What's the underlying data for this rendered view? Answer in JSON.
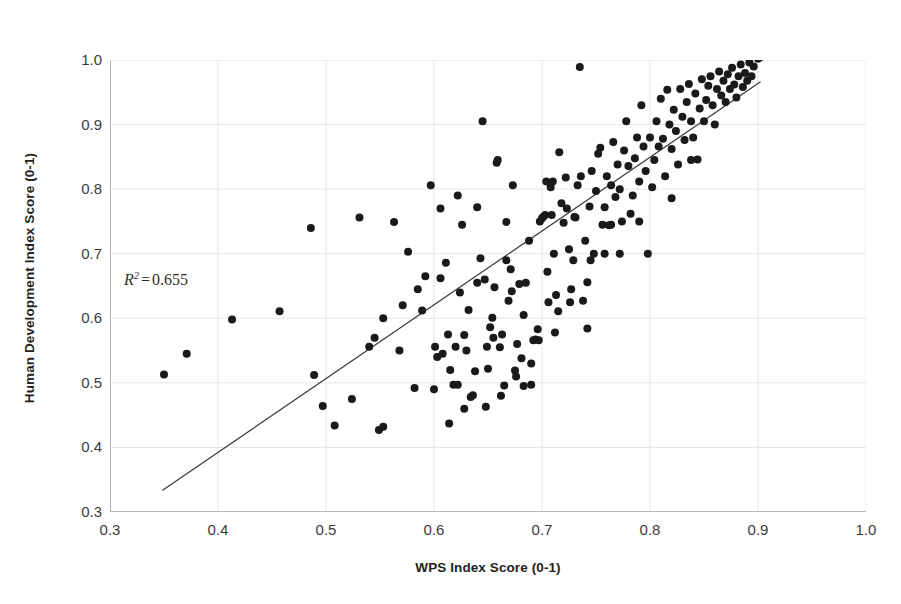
{
  "chart_data": {
    "type": "scatter",
    "title": "",
    "xlabel": "WPS Index Score (0-1)",
    "ylabel": "Human Development Index Score (0-1)",
    "xlim": [
      0.3,
      1.0
    ],
    "ylim": [
      0.3,
      1.0
    ],
    "xticks": [
      "0.3",
      "0.4",
      "0.5",
      "0.6",
      "0.7",
      "0.8",
      "0.9",
      "1.0"
    ],
    "yticks": [
      "0.3",
      "0.4",
      "0.5",
      "0.6",
      "0.7",
      "0.8",
      "0.9",
      "1.0"
    ],
    "xtick_values": [
      0.3,
      0.4,
      0.5,
      0.6,
      0.7,
      0.8,
      0.9,
      1.0
    ],
    "ytick_values": [
      0.3,
      0.4,
      0.5,
      0.6,
      0.7,
      0.8,
      0.9,
      1.0
    ],
    "grid": true,
    "grid_color": "#e8e4e4",
    "legend": "none",
    "marker": {
      "shape": "circle",
      "color": "#1a1a1a",
      "size_px": 8
    },
    "annotations": [
      {
        "name": "r-squared",
        "symbol": "R",
        "superscript": "2",
        "equals": "=",
        "value": "0.655",
        "text": "R² = 0.655",
        "x": 0.317,
        "y": 0.633
      }
    ],
    "trendline": {
      "type": "linear",
      "color": "#3a3a3a",
      "width_px": 1.2,
      "x_start": 0.349,
      "y_start": 0.334,
      "x_end": 0.902,
      "y_end": 0.966,
      "slope": 1.142,
      "intercept": -0.065,
      "r_squared": 0.655
    },
    "points": [
      [
        0.35,
        0.513
      ],
      [
        0.371,
        0.545
      ],
      [
        0.413,
        0.598
      ],
      [
        0.457,
        0.611
      ],
      [
        0.486,
        0.74
      ],
      [
        0.489,
        0.512
      ],
      [
        0.497,
        0.464
      ],
      [
        0.508,
        0.434
      ],
      [
        0.524,
        0.475
      ],
      [
        0.531,
        0.756
      ],
      [
        0.54,
        0.556
      ],
      [
        0.545,
        0.57
      ],
      [
        0.549,
        0.427
      ],
      [
        0.553,
        0.432
      ],
      [
        0.563,
        0.749
      ],
      [
        0.568,
        0.55
      ],
      [
        0.576,
        0.703
      ],
      [
        0.582,
        0.492
      ],
      [
        0.589,
        0.612
      ],
      [
        0.592,
        0.665
      ],
      [
        0.597,
        0.806
      ],
      [
        0.601,
        0.556
      ],
      [
        0.603,
        0.54
      ],
      [
        0.606,
        0.662
      ],
      [
        0.608,
        0.545
      ],
      [
        0.611,
        0.686
      ],
      [
        0.613,
        0.575
      ],
      [
        0.615,
        0.52
      ],
      [
        0.618,
        0.497
      ],
      [
        0.62,
        0.556
      ],
      [
        0.622,
        0.497
      ],
      [
        0.624,
        0.64
      ],
      [
        0.626,
        0.745
      ],
      [
        0.628,
        0.574
      ],
      [
        0.63,
        0.55
      ],
      [
        0.632,
        0.613
      ],
      [
        0.634,
        0.478
      ],
      [
        0.636,
        0.481
      ],
      [
        0.638,
        0.518
      ],
      [
        0.64,
        0.772
      ],
      [
        0.643,
        0.693
      ],
      [
        0.645,
        0.905
      ],
      [
        0.647,
        0.66
      ],
      [
        0.649,
        0.556
      ],
      [
        0.65,
        0.522
      ],
      [
        0.652,
        0.586
      ],
      [
        0.654,
        0.601
      ],
      [
        0.656,
        0.648
      ],
      [
        0.658,
        0.841
      ],
      [
        0.659,
        0.845
      ],
      [
        0.661,
        0.555
      ],
      [
        0.663,
        0.575
      ],
      [
        0.665,
        0.496
      ],
      [
        0.667,
        0.749
      ],
      [
        0.669,
        0.627
      ],
      [
        0.671,
        0.676
      ],
      [
        0.673,
        0.806
      ],
      [
        0.675,
        0.519
      ],
      [
        0.677,
        0.56
      ],
      [
        0.679,
        0.653
      ],
      [
        0.681,
        0.538
      ],
      [
        0.683,
        0.605
      ],
      [
        0.685,
        0.655
      ],
      [
        0.688,
        0.72
      ],
      [
        0.69,
        0.497
      ],
      [
        0.692,
        0.566
      ],
      [
        0.694,
        0.567
      ],
      [
        0.696,
        0.583
      ],
      [
        0.698,
        0.75
      ],
      [
        0.7,
        0.755
      ],
      [
        0.701,
        0.757
      ],
      [
        0.703,
        0.76
      ],
      [
        0.705,
        0.672
      ],
      [
        0.706,
        0.625
      ],
      [
        0.708,
        0.803
      ],
      [
        0.71,
        0.812
      ],
      [
        0.711,
        0.7
      ],
      [
        0.713,
        0.636
      ],
      [
        0.715,
        0.611
      ],
      [
        0.716,
        0.857
      ],
      [
        0.718,
        0.778
      ],
      [
        0.72,
        0.748
      ],
      [
        0.722,
        0.818
      ],
      [
        0.723,
        0.77
      ],
      [
        0.725,
        0.707
      ],
      [
        0.727,
        0.645
      ],
      [
        0.729,
        0.69
      ],
      [
        0.731,
        0.756
      ],
      [
        0.733,
        0.806
      ],
      [
        0.735,
        0.989
      ],
      [
        0.736,
        0.82
      ],
      [
        0.738,
        0.627
      ],
      [
        0.74,
        0.72
      ],
      [
        0.742,
        0.584
      ],
      [
        0.744,
        0.773
      ],
      [
        0.746,
        0.828
      ],
      [
        0.748,
        0.7
      ],
      [
        0.75,
        0.797
      ],
      [
        0.752,
        0.855
      ],
      [
        0.754,
        0.864
      ],
      [
        0.756,
        0.745
      ],
      [
        0.758,
        0.772
      ],
      [
        0.76,
        0.82
      ],
      [
        0.762,
        0.744
      ],
      [
        0.764,
        0.806
      ],
      [
        0.766,
        0.873
      ],
      [
        0.768,
        0.788
      ],
      [
        0.77,
        0.838
      ],
      [
        0.772,
        0.8
      ],
      [
        0.774,
        0.75
      ],
      [
        0.776,
        0.86
      ],
      [
        0.778,
        0.905
      ],
      [
        0.78,
        0.836
      ],
      [
        0.782,
        0.762
      ],
      [
        0.784,
        0.79
      ],
      [
        0.786,
        0.848
      ],
      [
        0.788,
        0.88
      ],
      [
        0.79,
        0.812
      ],
      [
        0.792,
        0.93
      ],
      [
        0.794,
        0.866
      ],
      [
        0.796,
        0.828
      ],
      [
        0.798,
        0.7
      ],
      [
        0.8,
        0.88
      ],
      [
        0.802,
        0.803
      ],
      [
        0.804,
        0.845
      ],
      [
        0.806,
        0.905
      ],
      [
        0.808,
        0.866
      ],
      [
        0.81,
        0.94
      ],
      [
        0.812,
        0.878
      ],
      [
        0.814,
        0.82
      ],
      [
        0.816,
        0.954
      ],
      [
        0.818,
        0.9
      ],
      [
        0.82,
        0.862
      ],
      [
        0.822,
        0.923
      ],
      [
        0.824,
        0.89
      ],
      [
        0.826,
        0.838
      ],
      [
        0.828,
        0.955
      ],
      [
        0.83,
        0.912
      ],
      [
        0.832,
        0.876
      ],
      [
        0.834,
        0.935
      ],
      [
        0.836,
        0.963
      ],
      [
        0.838,
        0.905
      ],
      [
        0.84,
        0.88
      ],
      [
        0.842,
        0.948
      ],
      [
        0.844,
        0.846
      ],
      [
        0.846,
        0.925
      ],
      [
        0.848,
        0.97
      ],
      [
        0.85,
        0.905
      ],
      [
        0.852,
        0.938
      ],
      [
        0.854,
        0.96
      ],
      [
        0.856,
        0.975
      ],
      [
        0.858,
        0.93
      ],
      [
        0.86,
        0.9
      ],
      [
        0.862,
        0.955
      ],
      [
        0.864,
        0.982
      ],
      [
        0.866,
        0.945
      ],
      [
        0.868,
        0.968
      ],
      [
        0.87,
        0.935
      ],
      [
        0.872,
        0.978
      ],
      [
        0.874,
        0.955
      ],
      [
        0.876,
        0.988
      ],
      [
        0.878,
        0.962
      ],
      [
        0.88,
        0.942
      ],
      [
        0.882,
        0.975
      ],
      [
        0.884,
        0.993
      ],
      [
        0.886,
        0.958
      ],
      [
        0.888,
        0.98
      ],
      [
        0.89,
        0.968
      ],
      [
        0.892,
        0.996
      ],
      [
        0.894,
        0.975
      ],
      [
        0.896,
        0.99
      ],
      [
        0.9,
        1.002
      ],
      [
        0.903,
        1.005
      ],
      [
        0.704,
        0.812
      ],
      [
        0.709,
        0.76
      ],
      [
        0.73,
        0.757
      ],
      [
        0.764,
        0.745
      ],
      [
        0.667,
        0.69
      ],
      [
        0.672,
        0.642
      ],
      [
        0.64,
        0.655
      ],
      [
        0.655,
        0.57
      ],
      [
        0.683,
        0.495
      ],
      [
        0.697,
        0.566
      ],
      [
        0.745,
        0.69
      ],
      [
        0.758,
        0.7
      ],
      [
        0.772,
        0.7
      ],
      [
        0.82,
        0.786
      ],
      [
        0.838,
        0.845
      ],
      [
        0.79,
        0.75
      ],
      [
        0.712,
        0.578
      ],
      [
        0.726,
        0.625
      ],
      [
        0.742,
        0.656
      ],
      [
        0.6,
        0.49
      ],
      [
        0.614,
        0.437
      ],
      [
        0.628,
        0.46
      ],
      [
        0.648,
        0.463
      ],
      [
        0.662,
        0.48
      ],
      [
        0.676,
        0.51
      ],
      [
        0.69,
        0.53
      ],
      [
        0.553,
        0.6
      ],
      [
        0.571,
        0.62
      ],
      [
        0.585,
        0.645
      ],
      [
        0.606,
        0.77
      ],
      [
        0.622,
        0.79
      ]
    ]
  }
}
